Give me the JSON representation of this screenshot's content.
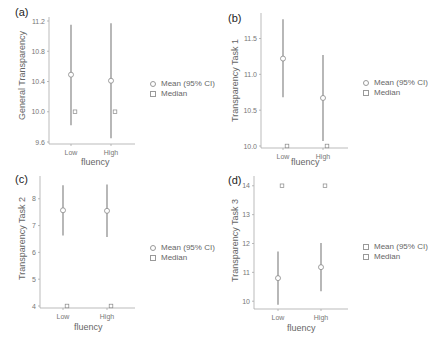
{
  "figure": {
    "legend": {
      "mean_label": "Mean (95% CI)",
      "median_label": "Median"
    },
    "xlabel": "fluency"
  },
  "chart_data": [
    {
      "type": "scatter",
      "panel": "(a)",
      "title": "",
      "xlabel": "fluency",
      "ylabel": "General Transparency",
      "categories": [
        "Low",
        "High"
      ],
      "ylim": [
        9.6,
        11.2
      ],
      "yticks": [
        "9.6",
        "10.0",
        "10.4",
        "10.8",
        "11.2"
      ],
      "series": [
        {
          "name": "Mean (95% CI)",
          "values": [
            10.49,
            10.41
          ],
          "ci_low": [
            9.82,
            9.65
          ],
          "ci_high": [
            11.15,
            11.17
          ]
        },
        {
          "name": "Median",
          "values": [
            10.0,
            10.0
          ]
        }
      ],
      "grid": false,
      "legend_position": "right"
    },
    {
      "type": "scatter",
      "panel": "(b)",
      "title": "",
      "xlabel": "fluency",
      "ylabel": "Transparency Task 1",
      "categories": [
        "Low",
        "High"
      ],
      "ylim": [
        10.0,
        11.8
      ],
      "yticks": [
        "10.0",
        "10.5",
        "11.0",
        "11.5"
      ],
      "series": [
        {
          "name": "Mean (95% CI)",
          "values": [
            11.22,
            10.67
          ],
          "ci_low": [
            10.68,
            10.07
          ],
          "ci_high": [
            11.77,
            11.27
          ]
        },
        {
          "name": "Median",
          "values": [
            10.0,
            10.0
          ]
        }
      ],
      "grid": false,
      "legend_position": "right"
    },
    {
      "type": "scatter",
      "panel": "(c)",
      "title": "",
      "xlabel": "fluency",
      "ylabel": "Transparency Task 2",
      "categories": [
        "Low",
        "High"
      ],
      "ylim": [
        4,
        8.7
      ],
      "yticks": [
        "4",
        "5",
        "6",
        "7",
        "8"
      ],
      "series": [
        {
          "name": "Mean (95% CI)",
          "values": [
            7.57,
            7.55
          ],
          "ci_low": [
            6.63,
            6.57
          ],
          "ci_high": [
            8.5,
            8.53
          ]
        },
        {
          "name": "Median",
          "values": [
            4,
            4
          ]
        }
      ],
      "grid": false,
      "legend_position": "right"
    },
    {
      "type": "scatter",
      "panel": "(d)",
      "title": "",
      "xlabel": "fluency",
      "ylabel": "Transparency Task 3",
      "categories": [
        "Low",
        "High"
      ],
      "ylim": [
        9.8,
        14.2
      ],
      "yticks": [
        "10",
        "11",
        "12",
        "13",
        "14"
      ],
      "series": [
        {
          "name": "Mean (95% CI)",
          "values": [
            10.8,
            11.18
          ],
          "ci_low": [
            9.88,
            10.35
          ],
          "ci_high": [
            11.72,
            12.02
          ]
        },
        {
          "name": "Median",
          "values": [
            14,
            14
          ]
        }
      ],
      "grid": false,
      "legend_position": "right"
    }
  ]
}
